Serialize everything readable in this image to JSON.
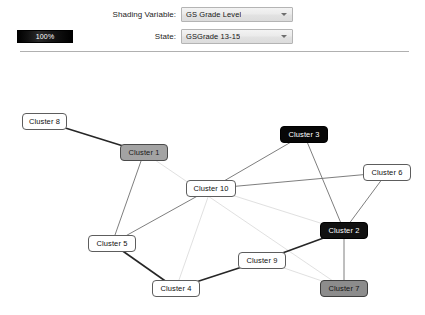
{
  "controls": {
    "shading_variable": {
      "label": "Shading Variable:",
      "value": "GS Grade Level",
      "arrow_icon": "chevron-down-icon"
    },
    "state": {
      "label": "State:",
      "value": "GSGrade 13-15",
      "arrow_icon": "chevron-down-icon"
    }
  },
  "legend": {
    "text": "100%",
    "bar_color": "#000000",
    "text_color": "#ffffff"
  },
  "graph": {
    "nodes": [
      {
        "id": "cluster8",
        "label": "Cluster 8",
        "x": 22,
        "y": 57,
        "w": 45,
        "h": 17,
        "shade": "light"
      },
      {
        "id": "cluster1",
        "label": "Cluster 1",
        "x": 120,
        "y": 88,
        "w": 48,
        "h": 17,
        "shade": "gray"
      },
      {
        "id": "cluster3",
        "label": "Cluster 3",
        "x": 280,
        "y": 70,
        "w": 48,
        "h": 17,
        "shade": "black"
      },
      {
        "id": "cluster6",
        "label": "Cluster 6",
        "x": 363,
        "y": 108,
        "w": 48,
        "h": 17,
        "shade": "light"
      },
      {
        "id": "cluster10",
        "label": "Cluster 10",
        "x": 186,
        "y": 124,
        "w": 50,
        "h": 17,
        "shade": "light"
      },
      {
        "id": "cluster2",
        "label": "Cluster 2",
        "x": 320,
        "y": 166,
        "w": 48,
        "h": 17,
        "shade": "dark"
      },
      {
        "id": "cluster5",
        "label": "Cluster 5",
        "x": 88,
        "y": 179,
        "w": 48,
        "h": 17,
        "shade": "light"
      },
      {
        "id": "cluster9",
        "label": "Cluster 9",
        "x": 238,
        "y": 196,
        "w": 48,
        "h": 17,
        "shade": "light"
      },
      {
        "id": "cluster4",
        "label": "Cluster 4",
        "x": 152,
        "y": 224,
        "w": 48,
        "h": 17,
        "shade": "light"
      },
      {
        "id": "cluster7",
        "label": "Cluster 7",
        "x": 320,
        "y": 224,
        "w": 48,
        "h": 17,
        "shade": "gray-dark"
      }
    ],
    "edges": [
      {
        "from": "cluster8",
        "to": "cluster1",
        "weight": "strong"
      },
      {
        "from": "cluster1",
        "to": "cluster7",
        "weight": "faint"
      },
      {
        "from": "cluster1",
        "to": "cluster5",
        "weight": "medium"
      },
      {
        "from": "cluster10",
        "to": "cluster3",
        "weight": "medium"
      },
      {
        "from": "cluster10",
        "to": "cluster6",
        "weight": "medium"
      },
      {
        "from": "cluster10",
        "to": "cluster4",
        "weight": "faint"
      },
      {
        "from": "cluster10",
        "to": "cluster2",
        "weight": "faint"
      },
      {
        "from": "cluster10",
        "to": "cluster5",
        "weight": "medium"
      },
      {
        "from": "cluster3",
        "to": "cluster2",
        "weight": "medium"
      },
      {
        "from": "cluster6",
        "to": "cluster2",
        "weight": "medium"
      },
      {
        "from": "cluster5",
        "to": "cluster4",
        "weight": "strong"
      },
      {
        "from": "cluster4",
        "to": "cluster9",
        "weight": "strong"
      },
      {
        "from": "cluster9",
        "to": "cluster2",
        "weight": "strong"
      },
      {
        "from": "cluster2",
        "to": "cluster7",
        "weight": "medium"
      },
      {
        "from": "cluster9",
        "to": "cluster7",
        "weight": "faint"
      }
    ]
  }
}
